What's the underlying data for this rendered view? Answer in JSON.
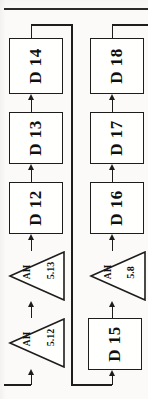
{
  "document": {
    "kind": "scanned-flowchart-page",
    "orientation": "rotated-90-ccw",
    "page_rule_visible": true
  },
  "diagram": {
    "title": "",
    "columns": [
      {
        "name": "left-column",
        "nodes": [
          {
            "id": "node-d14",
            "type": "process",
            "label": "D 14"
          },
          {
            "id": "node-d13",
            "type": "process",
            "label": "D 13"
          },
          {
            "id": "node-d12",
            "type": "process",
            "label": "D 12"
          },
          {
            "id": "node-ah-513",
            "type": "delay",
            "label": "AH",
            "sublabel": "5.13"
          },
          {
            "id": "node-ah-512",
            "type": "delay",
            "label": "AH",
            "sublabel": "5.12"
          }
        ]
      },
      {
        "name": "right-column",
        "nodes": [
          {
            "id": "node-d18",
            "type": "process",
            "label": "D 18"
          },
          {
            "id": "node-d17",
            "type": "process",
            "label": "D 17"
          },
          {
            "id": "node-d16",
            "type": "process",
            "label": "D 16"
          },
          {
            "id": "node-ah-58",
            "type": "delay",
            "label": "AH",
            "sublabel": "5.8"
          },
          {
            "id": "node-d15",
            "type": "process",
            "label": "D 15"
          }
        ]
      }
    ],
    "edges": [
      {
        "id": "edge-in-to-ah512",
        "from": "page-left-edge",
        "to": "node-ah-512"
      },
      {
        "id": "edge-ah512-to-ah513",
        "from": "node-ah-512",
        "to": "node-ah-513"
      },
      {
        "id": "edge-ah513-to-d12",
        "from": "node-ah-513",
        "to": "node-d12"
      },
      {
        "id": "edge-d12-to-d13",
        "from": "node-d12",
        "to": "node-d13"
      },
      {
        "id": "edge-d13-to-d14",
        "from": "node-d13",
        "to": "node-d14"
      },
      {
        "id": "edge-d14-to-d15",
        "from": "node-d14",
        "to": "node-d15"
      },
      {
        "id": "edge-d15-to-ah58",
        "from": "node-d15",
        "to": "node-ah-58"
      },
      {
        "id": "edge-ah58-to-d16",
        "from": "node-ah-58",
        "to": "node-d16"
      },
      {
        "id": "edge-d16-to-d17",
        "from": "node-d16",
        "to": "node-d17"
      },
      {
        "id": "edge-d17-to-d18",
        "from": "node-d17",
        "to": "node-d18"
      },
      {
        "id": "edge-d18-out",
        "from": "node-d18",
        "to": "page-right-edge"
      }
    ],
    "colors": {
      "ink": "#1d1d1b",
      "paper": "#fbfaf8",
      "box_fill": "#fffffe"
    }
  }
}
